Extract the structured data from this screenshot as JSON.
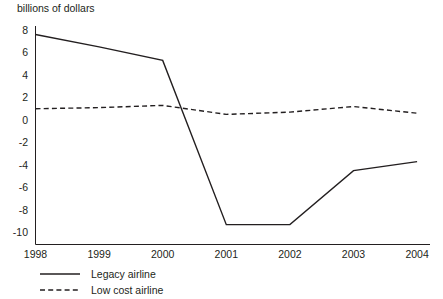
{
  "chart_data": {
    "type": "line",
    "title": "billions of dollars",
    "xlabel": "",
    "ylabel": "billions of dollars",
    "categories": [
      "1998",
      "1999",
      "2000",
      "2001",
      "2002",
      "2003",
      "2004"
    ],
    "x": [
      1998,
      1999,
      2000,
      2001,
      2002,
      2003,
      2004
    ],
    "ylim": [
      -10,
      8
    ],
    "yticks": [
      "8",
      "6",
      "4",
      "2",
      "0",
      "-2",
      "-4",
      "-6",
      "-8",
      "-10"
    ],
    "ytick_values": [
      8,
      6,
      4,
      2,
      0,
      -2,
      -4,
      -6,
      -8,
      -10
    ],
    "grid": false,
    "legend_position": "bottom-left",
    "series": [
      {
        "name": "Legacy airline",
        "style": "solid",
        "color": "#231f20",
        "values": [
          7.6,
          6.5,
          5.3,
          -9.3,
          -9.3,
          -4.5,
          -3.7
        ]
      },
      {
        "name": "Low cost airline",
        "style": "dashed",
        "color": "#231f20",
        "values": [
          1.0,
          1.1,
          1.3,
          0.5,
          0.7,
          1.2,
          0.6
        ]
      }
    ]
  },
  "axes": {
    "y_axis_name": "y-axis",
    "x_axis_name": "x-axis"
  },
  "legend": {
    "items": [
      {
        "label": "Legacy airline",
        "style": "solid"
      },
      {
        "label": "Low cost airline",
        "style": "dashed"
      }
    ]
  }
}
